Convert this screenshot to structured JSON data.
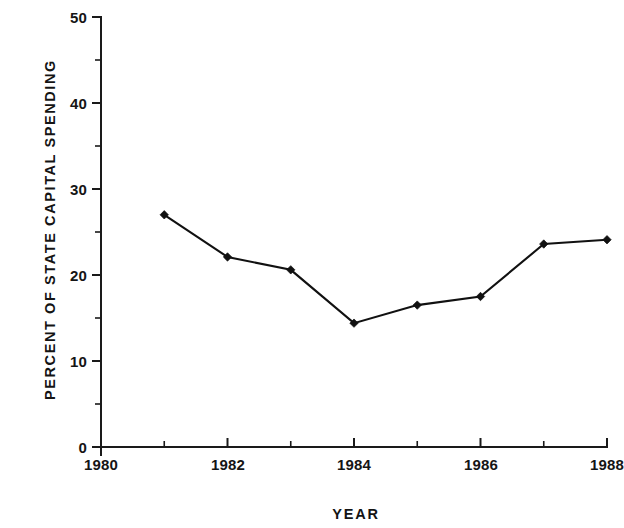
{
  "chart_data": {
    "type": "line",
    "title": "",
    "xlabel": "YEAR",
    "ylabel": "PERCENT OF STATE CAPITAL SPENDING",
    "x": [
      1981,
      1982,
      1983,
      1984,
      1985,
      1986,
      1987,
      1988
    ],
    "values": [
      27.0,
      22.1,
      20.6,
      14.4,
      16.5,
      17.5,
      23.6,
      24.1
    ],
    "series": [
      {
        "name": "Percent of state capital spending",
        "values": [
          27.0,
          22.1,
          20.6,
          14.4,
          16.5,
          17.5,
          23.6,
          24.1
        ]
      }
    ],
    "xlim": [
      1980,
      1988
    ],
    "ylim": [
      0,
      50
    ],
    "xticks": [
      1980,
      1982,
      1984,
      1986,
      1988
    ],
    "xtick_labels": [
      "1980",
      "1982",
      "1984",
      "1986",
      "1988"
    ],
    "xticks_minor": [
      1981,
      1983,
      1985,
      1987
    ],
    "yticks": [
      0,
      10,
      20,
      30,
      40,
      50
    ],
    "ytick_labels": [
      "0",
      "10",
      "20",
      "30",
      "40",
      "50"
    ],
    "yticks_minor": [
      5,
      15,
      25,
      35,
      45
    ],
    "grid": false,
    "legend": "none",
    "line_color": "#111111",
    "marker": "diamond",
    "marker_color": "#111111",
    "background_color": "#ffffff"
  }
}
